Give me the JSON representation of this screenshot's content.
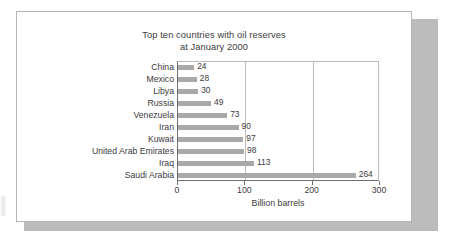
{
  "figure": {
    "card_border_color": "#b4b4b4",
    "shadow_color": "#bcbcbc",
    "background_color": "#ffffff"
  },
  "chart_data": {
    "type": "bar",
    "orientation": "horizontal",
    "title": "Top ten countries with oil reserves",
    "subtitle": "at January 2000",
    "title_line1": "Top ten countries with oil reserves",
    "title_line2": "at January 2000",
    "xlabel": "Billion barrels",
    "ylabel": "",
    "categories": [
      "China",
      "Mexico",
      "Libya",
      "Russia",
      "Venezuela",
      "Iran",
      "Kuwait",
      "United Arab Emirates",
      "Iraq",
      "Saudi Arabia"
    ],
    "values": [
      24,
      28,
      30,
      49,
      73,
      90,
      97,
      98,
      113,
      264
    ],
    "value_labels": [
      "24",
      "28",
      "30",
      "49",
      "73",
      "90",
      "97",
      "98",
      "113",
      "264"
    ],
    "xlim": [
      0,
      300
    ],
    "xticks": [
      0,
      100,
      200,
      300
    ],
    "xtick_labels": [
      "0",
      "100",
      "200",
      "300"
    ],
    "gridlines": [
      100,
      200
    ],
    "grid": true,
    "legend": null,
    "bar_color": "#a9a9a9",
    "text_color": "#3b3b3b",
    "axis_color": "#6f6f6f",
    "grid_color": "#bdbdbd"
  }
}
